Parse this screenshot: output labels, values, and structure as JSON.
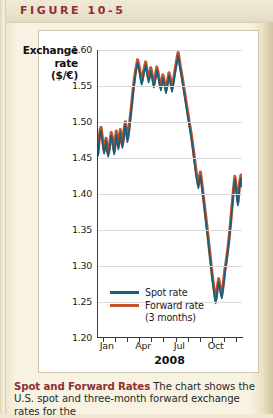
{
  "figure": {
    "label": "FIGURE 10-5"
  },
  "chart_data": {
    "type": "line",
    "title": "",
    "ylabel": "Exchange rate ($/€)",
    "ylabel_line1": "Exchange",
    "ylabel_line2": "rate",
    "ylabel_line3": "($/€)",
    "xlabel": "2008",
    "ylim": [
      1.2,
      1.6
    ],
    "yticks": [
      "1.20",
      "1.25",
      "1.30",
      "1.35",
      "1.40",
      "1.45",
      "1.50",
      "1.55",
      "1.60"
    ],
    "ytick_values": [
      1.2,
      1.25,
      1.3,
      1.35,
      1.4,
      1.45,
      1.5,
      1.55,
      1.6
    ],
    "xticks": [
      "Jan",
      "Apr",
      "Jul",
      "Oct"
    ],
    "xtick_positions": [
      0.04,
      0.29,
      0.54,
      0.79
    ],
    "grid": "horizontal",
    "legend_position": "bottom-left-inside",
    "colors": {
      "spot": "#15617d",
      "forward": "#c4522c",
      "grid": "#d9d9d9",
      "axis": "#3a3a3a"
    },
    "series": [
      {
        "name": "Spot rate",
        "color": "#15617d",
        "values": [
          1.462,
          1.453,
          1.47,
          1.484,
          1.488,
          1.477,
          1.466,
          1.456,
          1.464,
          1.473,
          1.46,
          1.452,
          1.458,
          1.47,
          1.481,
          1.476,
          1.464,
          1.455,
          1.468,
          1.483,
          1.475,
          1.462,
          1.47,
          1.485,
          1.476,
          1.464,
          1.472,
          1.488,
          1.496,
          1.484,
          1.472,
          1.48,
          1.492,
          1.505,
          1.518,
          1.532,
          1.545,
          1.556,
          1.567,
          1.574,
          1.582,
          1.576,
          1.569,
          1.56,
          1.552,
          1.557,
          1.566,
          1.573,
          1.579,
          1.57,
          1.562,
          1.555,
          1.562,
          1.571,
          1.565,
          1.556,
          1.548,
          1.554,
          1.563,
          1.572,
          1.566,
          1.558,
          1.55,
          1.544,
          1.552,
          1.561,
          1.555,
          1.547,
          1.54,
          1.546,
          1.556,
          1.564,
          1.558,
          1.549,
          1.542,
          1.55,
          1.559,
          1.568,
          1.576,
          1.585,
          1.592,
          1.584,
          1.574,
          1.566,
          1.558,
          1.549,
          1.54,
          1.531,
          1.522,
          1.513,
          1.504,
          1.495,
          1.487,
          1.478,
          1.468,
          1.457,
          1.446,
          1.435,
          1.424,
          1.416,
          1.408,
          1.418,
          1.426,
          1.415,
          1.403,
          1.391,
          1.379,
          1.367,
          1.355,
          1.343,
          1.33,
          1.317,
          1.304,
          1.291,
          1.279,
          1.268,
          1.258,
          1.248,
          1.256,
          1.269,
          1.278,
          1.27,
          1.262,
          1.255,
          1.264,
          1.276,
          1.289,
          1.298,
          1.308,
          1.319,
          1.331,
          1.345,
          1.36,
          1.376,
          1.392,
          1.408,
          1.42,
          1.409,
          1.396,
          1.384,
          1.4,
          1.415,
          1.422,
          1.41
        ]
      },
      {
        "name": "Forward rate (3 months)",
        "name_line1": "Forward rate",
        "name_line2": "(3 months)",
        "color": "#c4522c",
        "values": [
          1.466,
          1.4572,
          1.4742,
          1.4884,
          1.4924,
          1.4814,
          1.4704,
          1.4602,
          1.4684,
          1.4774,
          1.4644,
          1.4562,
          1.4622,
          1.4744,
          1.4854,
          1.4804,
          1.4684,
          1.4594,
          1.4724,
          1.4874,
          1.4794,
          1.4664,
          1.4744,
          1.4894,
          1.4804,
          1.4684,
          1.4764,
          1.4924,
          1.5004,
          1.4884,
          1.4764,
          1.4844,
          1.4964,
          1.5094,
          1.5224,
          1.5364,
          1.5494,
          1.5604,
          1.5714,
          1.5784,
          1.5864,
          1.5804,
          1.5734,
          1.5644,
          1.5564,
          1.5614,
          1.5704,
          1.5774,
          1.5834,
          1.5744,
          1.5664,
          1.5594,
          1.5664,
          1.5754,
          1.5694,
          1.5604,
          1.5524,
          1.5584,
          1.5674,
          1.5764,
          1.5704,
          1.5624,
          1.5544,
          1.5484,
          1.5564,
          1.5654,
          1.5594,
          1.5514,
          1.5444,
          1.5504,
          1.5604,
          1.5684,
          1.5624,
          1.5534,
          1.5464,
          1.5544,
          1.5634,
          1.5724,
          1.5804,
          1.5894,
          1.5964,
          1.5884,
          1.5784,
          1.5704,
          1.5624,
          1.5534,
          1.5444,
          1.5354,
          1.5264,
          1.5174,
          1.5084,
          1.4994,
          1.4914,
          1.4824,
          1.4724,
          1.4614,
          1.4504,
          1.4394,
          1.4284,
          1.4204,
          1.4124,
          1.4224,
          1.4304,
          1.4194,
          1.4074,
          1.3954,
          1.3834,
          1.3714,
          1.3594,
          1.3474,
          1.3344,
          1.3214,
          1.3084,
          1.2954,
          1.2834,
          1.2724,
          1.2624,
          1.2524,
          1.2604,
          1.2734,
          1.2824,
          1.2744,
          1.2664,
          1.2594,
          1.2684,
          1.2804,
          1.2934,
          1.3024,
          1.3124,
          1.3234,
          1.3354,
          1.3494,
          1.3644,
          1.3804,
          1.3964,
          1.4124,
          1.4244,
          1.4134,
          1.4004,
          1.3884,
          1.4044,
          1.4194,
          1.4264,
          1.4144
        ]
      }
    ]
  },
  "legend": {
    "spot_label": "Spot rate",
    "forward_label": "Forward rate",
    "forward_sub": "(3 months)"
  },
  "caption": {
    "title": "Spot and Forward Rates",
    "body": " The chart shows the U.S. spot and three-month forward exchange rates for the"
  }
}
